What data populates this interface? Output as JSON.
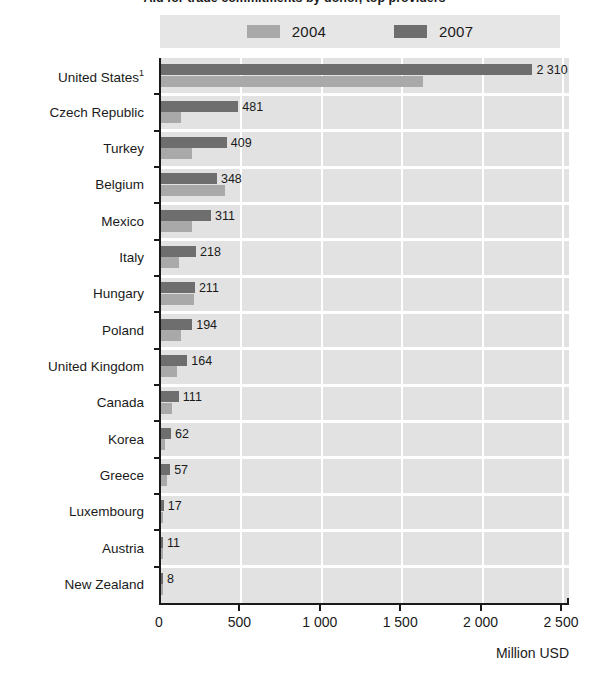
{
  "figure": {
    "title": "Aid for trade commitments by donor, top providers",
    "axis_unit": "Million USD"
  },
  "legend": {
    "position": "top-center",
    "entries": [
      {
        "label": "2004",
        "color": "#a8a8a8",
        "swatch_name": "legend-swatch-2004"
      },
      {
        "label": "2007",
        "color": "#6e6e6e",
        "swatch_name": "legend-swatch-2007"
      }
    ]
  },
  "chart_data": {
    "type": "bar",
    "orientation": "horizontal",
    "title": "Aid for trade commitments by donor, top providers",
    "xlabel": "Million USD",
    "ylabel": "",
    "xlim": [
      0,
      2550
    ],
    "grid": true,
    "legend_position": "top-center",
    "xticks": [
      0,
      500,
      1000,
      1500,
      2000,
      2500
    ],
    "xtick_labels": [
      "0",
      "500",
      "1 000",
      "1 500",
      "2 000",
      "2 500"
    ],
    "categories": [
      "United States¹",
      "Czech Republic",
      "Turkey",
      "Belgium",
      "Mexico",
      "Italy",
      "Hungary",
      "Poland",
      "United Kingdom",
      "Canada",
      "Korea",
      "Greece",
      "Luxembourg",
      "Austria",
      "New Zealand"
    ],
    "series": [
      {
        "name": "2004",
        "color": "#a9a9a9",
        "values": [
          1630,
          124,
          193,
          398,
          193,
          110,
          205,
          124,
          100,
          68,
          25,
          40,
          6,
          4,
          3
        ]
      },
      {
        "name": "2007",
        "color": "#6e6e6e",
        "labelled": true,
        "values": [
          2310,
          481,
          409,
          348,
          311,
          218,
          211,
          194,
          164,
          111,
          62,
          57,
          17,
          11,
          8
        ]
      }
    ],
    "value_labels": [
      "2 310",
      "481",
      "409",
      "348",
      "311",
      "218",
      "211",
      "194",
      "164",
      "111",
      "62",
      "57",
      "17",
      "11",
      "8"
    ],
    "footnote_marker": "1"
  }
}
